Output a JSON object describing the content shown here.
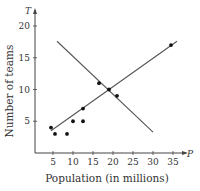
{
  "chart_data": {
    "type": "scatter",
    "title": "",
    "xlabel": "Population (in millions)",
    "ylabel": "Number of teams",
    "x_var": "P",
    "y_var": "T",
    "xlim": [
      0,
      37
    ],
    "ylim": [
      0,
      22
    ],
    "xticks": [
      5,
      10,
      15,
      20,
      25,
      30,
      35
    ],
    "yticks": [
      5,
      10,
      15,
      20
    ],
    "grid": false,
    "legend": null,
    "points": [
      {
        "x": 4.5,
        "y": 4
      },
      {
        "x": 5.5,
        "y": 3
      },
      {
        "x": 8.5,
        "y": 3
      },
      {
        "x": 10,
        "y": 5
      },
      {
        "x": 12.5,
        "y": 5
      },
      {
        "x": 12.5,
        "y": 7
      },
      {
        "x": 16.5,
        "y": 11
      },
      {
        "x": 19,
        "y": 10
      },
      {
        "x": 21,
        "y": 9
      },
      {
        "x": 34.5,
        "y": 17
      }
    ],
    "lines": [
      {
        "name": "increasing-fit-line",
        "from": [
          4.5,
          3.5
        ],
        "to": [
          36,
          17.6
        ]
      },
      {
        "name": "decreasing-fit-line",
        "from": [
          6,
          17.6
        ],
        "to": [
          30,
          3.3
        ]
      }
    ]
  },
  "colors": {
    "axis": "#444444",
    "line": "#555555",
    "point": "#111111"
  }
}
